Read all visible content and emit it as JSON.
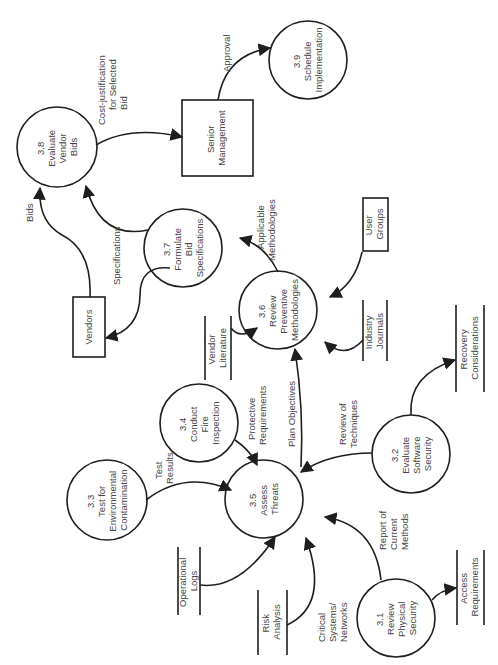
{
  "diagram": {
    "type": "data-flow-diagram",
    "orientation": "rotated-90-ccw",
    "processes": [
      {
        "id": "3.1",
        "number": "3.1",
        "lines": [
          "Review",
          "Physical",
          "Security"
        ]
      },
      {
        "id": "3.2",
        "number": "3.2",
        "lines": [
          "Evaluate",
          "Software",
          "Security"
        ]
      },
      {
        "id": "3.3",
        "number": "3.3",
        "lines": [
          "Test for",
          "Environmental",
          "Contamination"
        ]
      },
      {
        "id": "3.4",
        "number": "3.4",
        "lines": [
          "Conduct",
          "Fire",
          "Inspection"
        ]
      },
      {
        "id": "3.5",
        "number": "3.5",
        "lines": [
          "Assess",
          "Threats"
        ]
      },
      {
        "id": "3.6",
        "number": "3.6",
        "lines": [
          "Review",
          "Preventive",
          "Methodologies"
        ]
      },
      {
        "id": "3.7",
        "number": "3.7",
        "lines": [
          "Formulate",
          "Bid",
          "Specifications"
        ]
      },
      {
        "id": "3.8",
        "number": "3.8",
        "lines": [
          "Evaluate",
          "Vendor",
          "Bids"
        ]
      },
      {
        "id": "3.9",
        "number": "3.9",
        "lines": [
          "Schedule",
          "Implementation"
        ]
      }
    ],
    "external_entities": [
      {
        "id": "senior-management",
        "lines": [
          "Senior",
          "Management"
        ]
      },
      {
        "id": "vendors",
        "lines": [
          "Vendors"
        ]
      },
      {
        "id": "user-groups",
        "lines": [
          "User",
          "Groups"
        ]
      }
    ],
    "data_stores": [
      {
        "id": "vendor-literature",
        "lines": [
          "Vendor",
          "Literature"
        ]
      },
      {
        "id": "industry-journals",
        "lines": [
          "Industry",
          "Journals"
        ]
      },
      {
        "id": "recovery-considerations",
        "lines": [
          "Recovery",
          "Considerations"
        ]
      },
      {
        "id": "operational-logs",
        "lines": [
          "Operational",
          "Logs"
        ]
      },
      {
        "id": "risk-analysis",
        "lines": [
          "Risk",
          "Analysis"
        ]
      },
      {
        "id": "access-requirements",
        "lines": [
          "Access",
          "Requirements"
        ]
      }
    ],
    "flows": [
      {
        "from": "3.8",
        "to": "senior-management",
        "lines": [
          "Cost-justification",
          "for Selected",
          "Bid"
        ]
      },
      {
        "from": "senior-management",
        "to": "3.9",
        "lines": [
          "Approval"
        ]
      },
      {
        "from": "vendors",
        "to": "3.8",
        "lines": [
          "Bids"
        ]
      },
      {
        "from": "3.7",
        "to": "3.8",
        "lines": []
      },
      {
        "from": "3.7",
        "to": "vendors",
        "lines": [
          "Specifications"
        ]
      },
      {
        "from": "3.6",
        "to": "3.7",
        "lines": [
          "Applicable",
          "Methodologies"
        ]
      },
      {
        "from": "user-groups",
        "to": "3.6",
        "lines": []
      },
      {
        "from": "vendor-literature",
        "to": "3.6",
        "lines": []
      },
      {
        "from": "industry-journals",
        "to": "3.6",
        "lines": []
      },
      {
        "from": "3.5",
        "to": "3.6",
        "lines": [
          "Plan Objectives"
        ]
      },
      {
        "from": "3.4",
        "to": "3.5",
        "lines": [
          "Protective",
          "Requirements"
        ]
      },
      {
        "from": "3.3",
        "to": "3.5",
        "lines": [
          "Test",
          "Results"
        ]
      },
      {
        "from": "3.2",
        "to": "3.5",
        "lines": [
          "Review of",
          "Techniques"
        ]
      },
      {
        "from": "3.2",
        "to": "recovery-considerations",
        "lines": []
      },
      {
        "from": "operational-logs",
        "to": "3.5",
        "lines": []
      },
      {
        "from": "risk-analysis",
        "to": "3.5",
        "lines": [
          "Critical",
          "Systems/",
          "Networks"
        ]
      },
      {
        "from": "3.1",
        "to": "3.5",
        "lines": [
          "Report of",
          "Current",
          "Methods"
        ]
      },
      {
        "from": "3.1",
        "to": "access-requirements",
        "lines": []
      }
    ]
  },
  "colors": {
    "stroke": "#1e1e1e",
    "text": "#444444",
    "background": "#ffffff"
  }
}
